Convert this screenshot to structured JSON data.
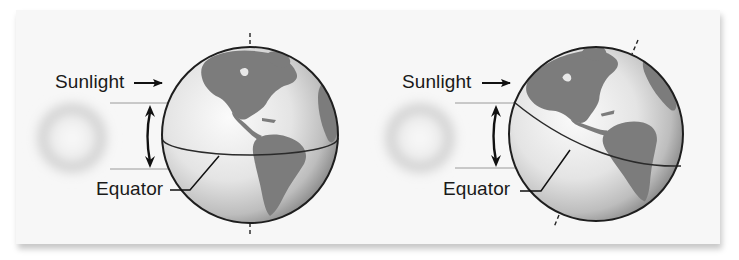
{
  "figure": {
    "panels": [
      {
        "id": "upright",
        "sunlight_label": "Sunlight",
        "equator_label": "Equator",
        "axis": "vertical"
      },
      {
        "id": "tilted",
        "sunlight_label": "Sunlight",
        "equator_label": "Equator",
        "axis": "tilted"
      }
    ]
  },
  "colors": {
    "panel_bg": "#f7f7f7",
    "ocean_light": "#f2f2f2",
    "ocean_dark": "#a9a9a9",
    "land": "#7c7c7c",
    "outline": "#1e1e1e",
    "sun_ring": "#c6c6c6",
    "beam_line": "#9a9a9a"
  },
  "icons": {
    "sunlight_arrow": "right-arrow",
    "beam_width_arrow": "double-headed-vertical-arrow"
  }
}
